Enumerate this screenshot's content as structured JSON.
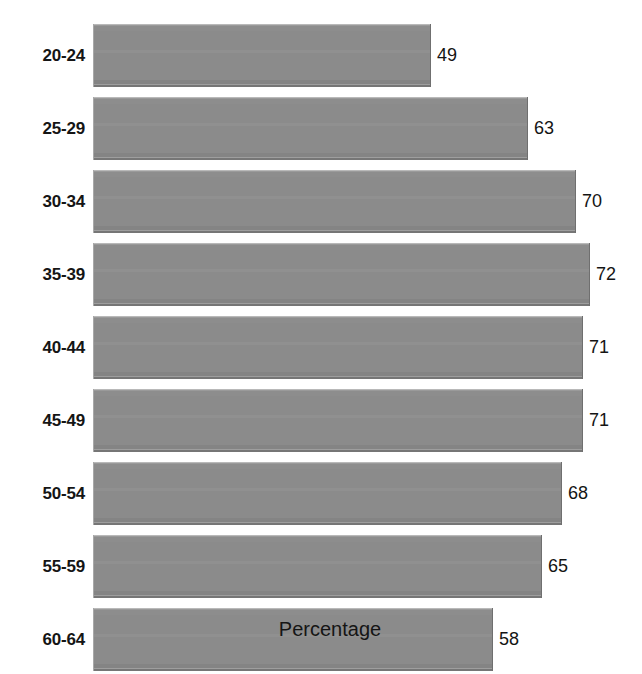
{
  "chart_data": {
    "type": "bar",
    "orientation": "horizontal",
    "title": "",
    "subtitle": "",
    "xlabel": "Percentage",
    "ylabel": "",
    "categories": [
      "20-24",
      "25-29",
      "30-34",
      "35-39",
      "40-44",
      "45-49",
      "50-54",
      "55-59",
      "60-64"
    ],
    "values": [
      49,
      63,
      70,
      72,
      71,
      71,
      68,
      65,
      58
    ],
    "data_labels": [
      "49",
      "63",
      "70",
      "72",
      "71",
      "71",
      "68",
      "65",
      "58"
    ],
    "xlim": [
      0,
      79
    ],
    "grid": false,
    "legend": null,
    "legend_position": "none",
    "axis_ticks": [],
    "bar_color": "#8b8b8b",
    "bar_edge_highlight": "#b9b9b9",
    "bar_edge_shadow": "#6f6f6f",
    "label_color": "#151515",
    "background": "#ffffff",
    "series": [
      {
        "name": "Percentage",
        "values": [
          49,
          63,
          70,
          72,
          71,
          71,
          68,
          65,
          58
        ]
      }
    ]
  },
  "axis": {
    "x_title": "Percentage"
  },
  "rows": [
    {
      "label": "20-24",
      "value": 49,
      "value_text": "49"
    },
    {
      "label": "25-29",
      "value": 63,
      "value_text": "63"
    },
    {
      "label": "30-34",
      "value": 70,
      "value_text": "70"
    },
    {
      "label": "35-39",
      "value": 72,
      "value_text": "72"
    },
    {
      "label": "40-44",
      "value": 71,
      "value_text": "71"
    },
    {
      "label": "45-49",
      "value": 71,
      "value_text": "71"
    },
    {
      "label": "50-54",
      "value": 68,
      "value_text": "68"
    },
    {
      "label": "55-59",
      "value": 65,
      "value_text": "65"
    },
    {
      "label": "60-64",
      "value": 58,
      "value_text": "58"
    }
  ],
  "geometry": {
    "bar_start_x": 93,
    "first_bar_top": 24,
    "bar_height": 63,
    "row_pitch": 73,
    "px_per_unit": 6.9,
    "value_label_offset": 6
  }
}
